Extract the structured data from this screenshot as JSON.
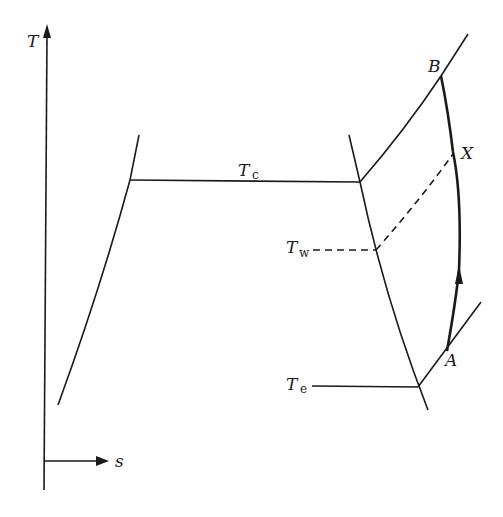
{
  "diagram": {
    "type": "T-s diagram (refrigeration cycle with superheat)",
    "axes": {
      "y_label": "T",
      "x_label": "s"
    },
    "labels": {
      "condensing_temp": {
        "main": "T",
        "sub": "c"
      },
      "wall_temp": {
        "main": "T",
        "sub": "w"
      },
      "evaporating_temp": {
        "main": "T",
        "sub": "e"
      },
      "point_A": "A",
      "point_B": "B",
      "point_X": "X"
    },
    "colors": {
      "line": "#1a1a1a",
      "background": "#ffffff"
    }
  }
}
